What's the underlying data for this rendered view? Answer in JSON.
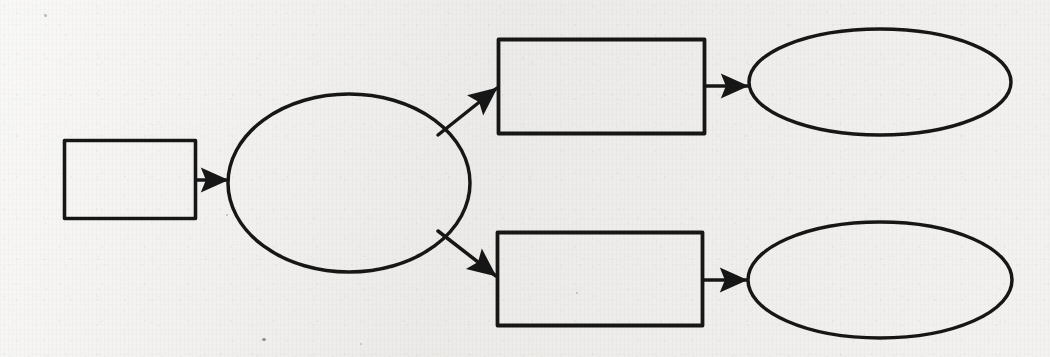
{
  "page": {
    "width": 1050,
    "height": 357,
    "medium": "scanned-paper",
    "paper_color": "#f1f0ee",
    "ink_color": "#1a1a1a"
  },
  "diagram": {
    "type": "flowchart",
    "title": "",
    "orientation": "left-to-right",
    "node_labels_present": false,
    "edge_labels_present": false,
    "nodes": [
      {
        "id": "n1",
        "name": "start-rectangle",
        "shape": "rectangle",
        "label": "",
        "x": 64,
        "y": 140,
        "width": 131,
        "height": 78
      },
      {
        "id": "n2",
        "name": "decision-ellipse",
        "shape": "ellipse",
        "label": "",
        "cx": 349,
        "cy": 183,
        "rx": 121,
        "ry": 89
      },
      {
        "id": "n3",
        "name": "upper-branch-rectangle",
        "shape": "rectangle",
        "label": "",
        "x": 498,
        "y": 39,
        "width": 206,
        "height": 94
      },
      {
        "id": "n4",
        "name": "upper-branch-ellipse",
        "shape": "ellipse",
        "label": "",
        "cx": 880,
        "cy": 82,
        "rx": 131,
        "ry": 53
      },
      {
        "id": "n5",
        "name": "lower-branch-rectangle",
        "shape": "rectangle",
        "label": "",
        "x": 497,
        "y": 232,
        "width": 205,
        "height": 93
      },
      {
        "id": "n6",
        "name": "lower-branch-ellipse",
        "shape": "ellipse",
        "label": "",
        "cx": 880,
        "cy": 280,
        "rx": 132,
        "ry": 58
      }
    ],
    "edges": [
      {
        "id": "e1",
        "name": "edge-start-to-decision",
        "from": "n1",
        "to": "n2",
        "label": "",
        "style": "solid-arrow",
        "direction": "horizontal",
        "x1": 196,
        "y1": 180,
        "x2": 231,
        "y2": 180
      },
      {
        "id": "e2",
        "name": "edge-decision-to-upper-rectangle",
        "from": "n2",
        "to": "n3",
        "label": "",
        "style": "solid-arrow",
        "direction": "diagonal-up-right",
        "x1": 440,
        "y1": 133,
        "x2": 500,
        "y2": 86
      },
      {
        "id": "e3",
        "name": "edge-upper-rectangle-to-upper-ellipse",
        "from": "n3",
        "to": "n4",
        "label": "",
        "style": "solid-arrow",
        "direction": "horizontal",
        "x1": 705,
        "y1": 86,
        "x2": 751,
        "y2": 86
      },
      {
        "id": "e4",
        "name": "edge-decision-to-lower-rectangle",
        "from": "n2",
        "to": "n5",
        "label": "",
        "style": "solid-arrow",
        "direction": "diagonal-down-right",
        "x1": 440,
        "y1": 232,
        "x2": 499,
        "y2": 277
      },
      {
        "id": "e5",
        "name": "edge-lower-rectangle-to-lower-ellipse",
        "from": "n5",
        "to": "n6",
        "label": "",
        "style": "solid-arrow",
        "direction": "horizontal",
        "x1": 703,
        "y1": 280,
        "x2": 750,
        "y2": 280
      }
    ]
  },
  "bleed_through": {
    "description": "illegible mirrored show-through from reverse side of sheet",
    "legible": false,
    "lines": [
      {
        "text": "",
        "x": 90,
        "y": 16,
        "size": 13
      },
      {
        "text": "",
        "x": 400,
        "y": 14,
        "size": 13
      },
      {
        "text": "",
        "x": 700,
        "y": 18,
        "size": 12
      },
      {
        "text": "",
        "x": 640,
        "y": 150,
        "size": 12
      },
      {
        "text": "",
        "x": 700,
        "y": 205,
        "size": 12
      },
      {
        "text": "",
        "x": 120,
        "y": 330,
        "size": 11
      }
    ]
  }
}
